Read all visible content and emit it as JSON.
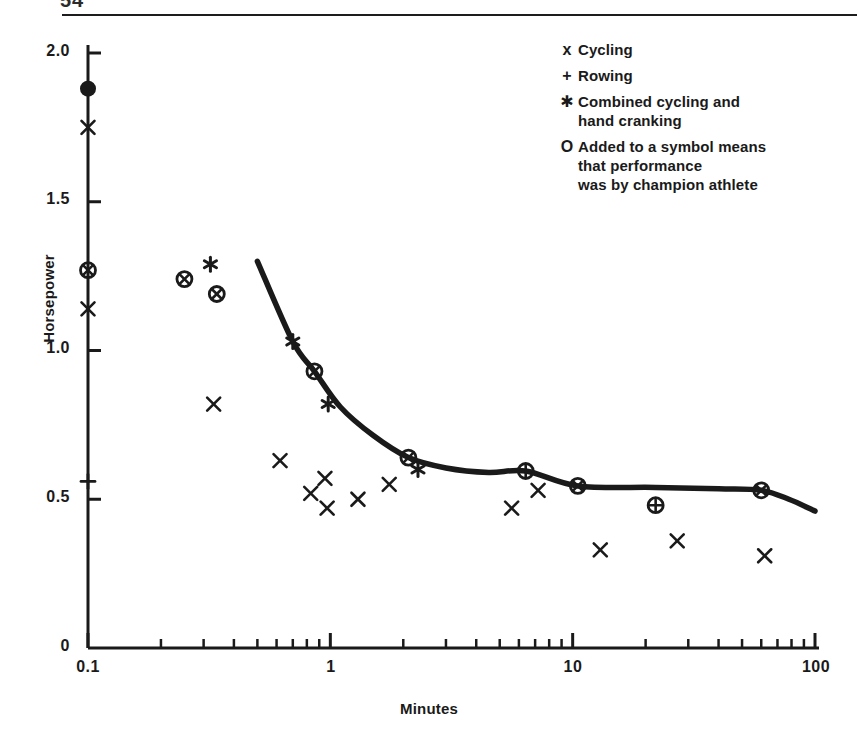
{
  "page": {
    "header_text": "54",
    "has_header_rule": true
  },
  "chart_data": {
    "type": "scatter",
    "title": "",
    "xlabel": "Minutes",
    "ylabel": "Horsepower",
    "xscale": "log",
    "yscale": "linear",
    "xlim": [
      0.1,
      100
    ],
    "ylim": [
      0,
      2.0
    ],
    "x_tick_labels": [
      "0.1",
      "1",
      "10",
      "100"
    ],
    "x_tick_values": [
      0.1,
      1,
      10,
      100
    ],
    "y_tick_labels": [
      "0",
      "0.5",
      "1.0",
      "1.5",
      "2.0"
    ],
    "y_tick_values": [
      0,
      0.5,
      1.0,
      1.5,
      2.0
    ],
    "grid": false,
    "legend_position": "top-right",
    "series": [
      {
        "name": "Cycling",
        "symbol": "x",
        "points": [
          {
            "x": 0.1,
            "y": 1.75
          },
          {
            "x": 0.1,
            "y": 1.14
          },
          {
            "x": 0.33,
            "y": 0.82
          },
          {
            "x": 0.62,
            "y": 0.63
          },
          {
            "x": 0.83,
            "y": 0.52
          },
          {
            "x": 0.95,
            "y": 0.57
          },
          {
            "x": 0.97,
            "y": 0.47
          },
          {
            "x": 1.3,
            "y": 0.5
          },
          {
            "x": 1.75,
            "y": 0.55
          },
          {
            "x": 5.6,
            "y": 0.47
          },
          {
            "x": 7.2,
            "y": 0.53
          },
          {
            "x": 13.0,
            "y": 0.33
          },
          {
            "x": 27.0,
            "y": 0.36
          },
          {
            "x": 62.0,
            "y": 0.31
          }
        ]
      },
      {
        "name": "Rowing",
        "symbol": "+",
        "points": [
          {
            "x": 0.1,
            "y": 0.56
          }
        ]
      },
      {
        "name": "Combined cycling and hand cranking",
        "symbol": "*",
        "points": [
          {
            "x": 0.32,
            "y": 1.29
          },
          {
            "x": 0.7,
            "y": 1.03
          },
          {
            "x": 0.98,
            "y": 0.82
          },
          {
            "x": 2.3,
            "y": 0.6
          }
        ]
      },
      {
        "name": "Cycling (champion)",
        "symbol": "circled-x",
        "points": [
          {
            "x": 0.1,
            "y": 1.27
          },
          {
            "x": 0.25,
            "y": 1.24
          },
          {
            "x": 0.34,
            "y": 1.19
          },
          {
            "x": 0.86,
            "y": 0.93
          },
          {
            "x": 2.1,
            "y": 0.64
          },
          {
            "x": 10.5,
            "y": 0.545
          },
          {
            "x": 60.0,
            "y": 0.53
          }
        ]
      },
      {
        "name": "Rowing (champion)",
        "symbol": "circled-plus",
        "points": [
          {
            "x": 6.4,
            "y": 0.595
          },
          {
            "x": 22.0,
            "y": 0.48
          }
        ]
      },
      {
        "name": "Combined cycling and hand cranking (champion)",
        "symbol": "filled-circle",
        "points": [
          {
            "x": 0.1,
            "y": 1.88
          }
        ]
      }
    ],
    "fitted_curve": {
      "name": "envelope curve",
      "points": [
        {
          "x": 0.5,
          "y": 1.3
        },
        {
          "x": 0.7,
          "y": 1.03
        },
        {
          "x": 0.86,
          "y": 0.93
        },
        {
          "x": 1.1,
          "y": 0.81
        },
        {
          "x": 1.5,
          "y": 0.715
        },
        {
          "x": 2.1,
          "y": 0.64
        },
        {
          "x": 3.0,
          "y": 0.605
        },
        {
          "x": 4.5,
          "y": 0.59
        },
        {
          "x": 6.4,
          "y": 0.595
        },
        {
          "x": 10.5,
          "y": 0.545
        },
        {
          "x": 22.0,
          "y": 0.54
        },
        {
          "x": 40.0,
          "y": 0.535
        },
        {
          "x": 60.0,
          "y": 0.53
        },
        {
          "x": 78.0,
          "y": 0.5
        },
        {
          "x": 100.0,
          "y": 0.46
        }
      ]
    }
  },
  "legend": {
    "entries": [
      {
        "symbol": "x",
        "line1": "Cycling",
        "line2": "",
        "line3": ""
      },
      {
        "symbol": "+",
        "line1": "Rowing",
        "line2": "",
        "line3": ""
      },
      {
        "symbol": "*",
        "line1": "Combined cycling and",
        "line2": "hand cranking",
        "line3": ""
      },
      {
        "symbol": "O",
        "line1": "Added to a symbol means",
        "line2": "that performance",
        "line3": "was by champion athlete"
      }
    ]
  },
  "colors": {
    "ink": "#1a1a1a",
    "background": "#ffffff"
  }
}
